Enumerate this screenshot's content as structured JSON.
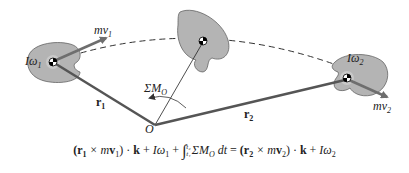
{
  "diagram": {
    "type": "principle of angular impulse and momentum for rigid body",
    "labels": {
      "momentum_1": "mv",
      "momentum_1_sub": "1",
      "angular_1": "Iω",
      "angular_1_sub": "1",
      "momentum_2": "mv",
      "momentum_2_sub": "2",
      "angular_2": "Iω",
      "angular_2_sub": "2",
      "position_1": "r",
      "position_1_sub": "1",
      "position_2": "r",
      "position_2_sub": "2",
      "moment_sum": "ΣM",
      "moment_sum_sub": "O",
      "origin": "O"
    },
    "equation": {
      "lhs_cross": "(r",
      "lhs_cross_sub": "1",
      "lhs_times": " × m",
      "lhs_v": "v",
      "lhs_v_sub": "1",
      "lhs_close": ") · ",
      "k1": "k",
      "plus1": " + ",
      "i1": "Iω",
      "i1_sub": "1",
      "plus2": " + ",
      "integral": "∫",
      "lower": "t₁",
      "upper": "t₂",
      "sum": "ΣM",
      "sum_sub": "O",
      "dt": " dt",
      "equals": " = ",
      "rhs_cross": "(r",
      "rhs_cross_sub": "2",
      "rhs_times": " × m",
      "rhs_v": "v",
      "rhs_v_sub": "2",
      "rhs_close": ") · ",
      "k2": "k",
      "plus3": " + ",
      "i2": "Iω",
      "i2_sub": "2"
    },
    "colors": {
      "body_fill": "#b4b4b4",
      "arrow": "#6e6e6e",
      "vector": "#555555",
      "line": "#222222"
    }
  }
}
